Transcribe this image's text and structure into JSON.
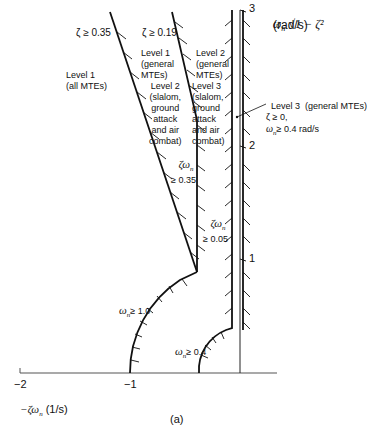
{
  "figure": {
    "caption": "(a)",
    "x_axis": {
      "label": "−ζω",
      "label_sub": "n",
      "label_units": " (1/s)",
      "ticks": [
        {
          "value": "−2",
          "x": 20
        },
        {
          "value": "−1",
          "x": 130
        }
      ]
    },
    "y_axis": {
      "label_main": "ω",
      "label_sub": "n",
      "label_rest": "√1 − ζ²",
      "units": "(rad/s)",
      "ticks": [
        {
          "value": "3",
          "y": 8
        },
        {
          "value": "2",
          "y": 145
        },
        {
          "value": "1",
          "y": 258
        }
      ]
    },
    "boundaries": [
      {
        "id": "zeta-035",
        "text": "ζ ≥ 0.35"
      },
      {
        "id": "zeta-019",
        "text": "ζ ≥ 0.19"
      },
      {
        "id": "zetawn-035",
        "line1": "ζω",
        "sub": "n",
        "line2": "≥ 0.35"
      },
      {
        "id": "zetawn-005",
        "line1": "ζω",
        "sub": "n",
        "line2": "≥ 0.05"
      },
      {
        "id": "wn-10",
        "pre": "ω",
        "sub": "n",
        "post": "≥ 1.0"
      },
      {
        "id": "wn-04",
        "pre": "ω",
        "sub": "n",
        "post": "≥ 0.4"
      }
    ],
    "regions": [
      {
        "id": "level1-all",
        "text": "Level 1\n(all MTEs)"
      },
      {
        "id": "level1-general",
        "text": "Level 1\n(general\nMTEs)"
      },
      {
        "id": "level2-slalom",
        "text": "Level 2\n(slalom,\nground\nattack\nand air\ncombat)"
      },
      {
        "id": "level2-general",
        "text": "Level 2\n(general\nMTEs)"
      },
      {
        "id": "level3-slalom",
        "text": "Level 3\n(slalom,\nground\nattack\nand air\ncombat)"
      }
    ],
    "level3_general": {
      "line1": "Level 3  (general MTEs)",
      "line2": "ζ ≥ 0,",
      "line3_pre": "ω",
      "line3_sub": "n",
      "line3_post": "≥ 0.4 rad/s"
    }
  }
}
